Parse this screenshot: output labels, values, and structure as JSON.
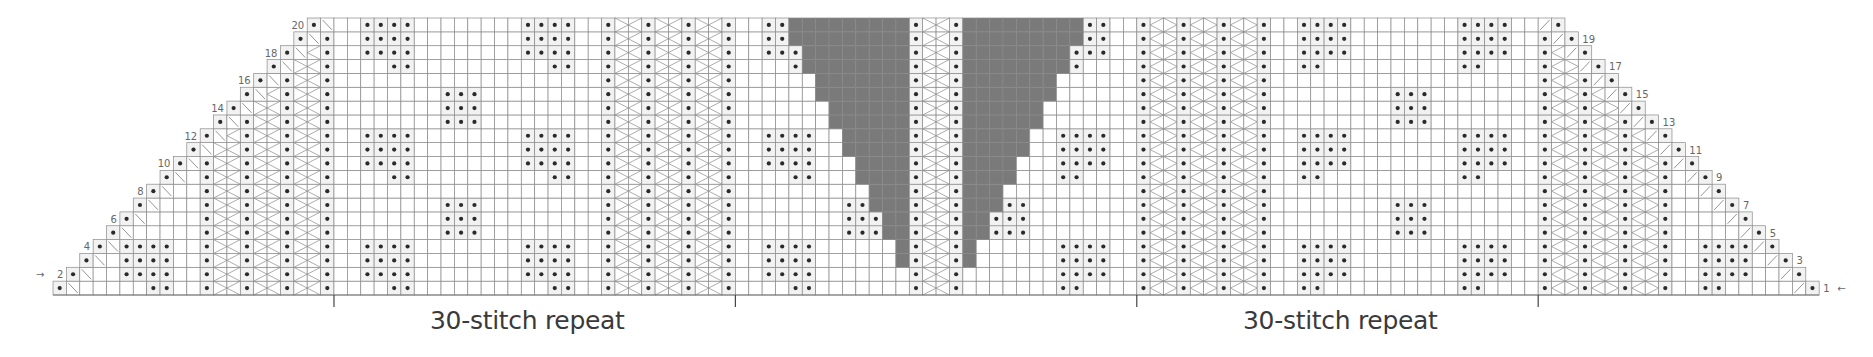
{
  "chart_title": "",
  "grid": {
    "rows": 20,
    "bottom_row_stitches": 132,
    "top_row_stitches": 94,
    "decrease_per_row_each_side": 1,
    "origin_x": 53,
    "bottom_y": 295,
    "cell_w": 13.38,
    "cell_h": 13.85,
    "line_color": "#8a8a8a",
    "dot_color": "#2a2a2a",
    "purl_bg": "#f2f2f2",
    "no_stitch_color": "#7a7a7a"
  },
  "row_labels": {
    "even_side": "left",
    "odd_side": "right",
    "labels": [
      "1",
      "2",
      "3",
      "4",
      "5",
      "6",
      "7",
      "8",
      "9",
      "10",
      "11",
      "12",
      "13",
      "14",
      "15",
      "16",
      "17",
      "18",
      "19",
      "20"
    ]
  },
  "start_arrows": {
    "row_1": "←",
    "row_2": "→"
  },
  "center": {
    "spine_cols": [
      64,
      65,
      66,
      67
    ],
    "left_gray_end_col": 63,
    "right_gray_start_col": 68,
    "gray_starts_row": 3,
    "gray_max_width": 9
  },
  "repeats": [
    {
      "label": "30-stitch repeat",
      "start_col": 21,
      "end_col": 51,
      "label_x": 430
    },
    {
      "label": "30-stitch repeat",
      "start_col": 81,
      "end_col": 111,
      "label_x": 1243
    }
  ],
  "legend_symbols": {
    "purl": "•",
    "decrease_left": "\\",
    "decrease_right": "/",
    "no_stitch": "gray",
    "cable_dots": "••"
  }
}
